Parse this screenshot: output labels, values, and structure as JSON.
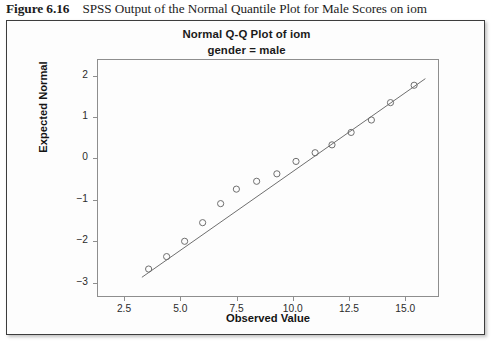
{
  "caption": {
    "label": "Figure 6.16",
    "text": "SPSS Output of the Normal Quantile Plot for Male Scores on iom"
  },
  "chart_data": {
    "type": "scatter",
    "title": "Normal Q-Q Plot of iom",
    "subtitle": "gender = male",
    "xlabel": "Observed Value",
    "ylabel": "Expected Normal",
    "xlim": [
      1.3,
      16.5
    ],
    "ylim": [
      -3.35,
      2.4
    ],
    "grid": false,
    "legend": null,
    "xticks": [
      "2.5",
      "5.0",
      "7.5",
      "10.0",
      "12.5",
      "15.0"
    ],
    "xtick_values": [
      2.5,
      5.0,
      7.5,
      10.0,
      12.5,
      15.0
    ],
    "yticks": [
      "2",
      "1",
      "0",
      "−1",
      "−2",
      "−3"
    ],
    "ytick_values": [
      2,
      1,
      0,
      -1,
      -2,
      -3
    ],
    "marker": "open-circle",
    "marker_color": "#6f6f6f",
    "line_color": "#6f6f6f",
    "x": [
      3.55,
      4.35,
      5.15,
      5.95,
      6.75,
      7.45,
      8.35,
      9.25,
      10.1,
      10.95,
      11.7,
      12.55,
      13.45,
      14.3,
      15.35
    ],
    "y": [
      -2.65,
      -2.35,
      -1.98,
      -1.53,
      -1.07,
      -0.72,
      -0.53,
      -0.35,
      -0.05,
      0.16,
      0.35,
      0.65,
      0.95,
      1.37,
      1.79
    ],
    "reference_line": {
      "x1": 3.25,
      "y1": -2.85,
      "x2": 15.85,
      "y2": 1.95
    }
  }
}
